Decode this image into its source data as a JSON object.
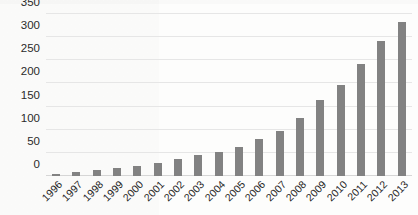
{
  "chart_data": {
    "type": "bar",
    "title": "",
    "subtitle": "",
    "xlabel": "",
    "ylabel": "",
    "categories": [
      "1996",
      "1997",
      "1998",
      "1999",
      "2000",
      "2001",
      "2002",
      "2003",
      "2004",
      "2005",
      "2006",
      "2007",
      "2008",
      "2009",
      "2010",
      "2011",
      "2012",
      "2013"
    ],
    "values": [
      5,
      8,
      12,
      17,
      22,
      28,
      37,
      45,
      52,
      62,
      80,
      98,
      125,
      165,
      197,
      242,
      292,
      332
    ],
    "series": [
      {
        "name": "Series 1",
        "values": [
          5,
          8,
          12,
          17,
          22,
          28,
          37,
          45,
          52,
          62,
          80,
          98,
          125,
          165,
          197,
          242,
          292,
          332
        ]
      }
    ],
    "ylim": [
      0,
      350
    ],
    "yticks": [
      0,
      50,
      100,
      150,
      200,
      250,
      300,
      350
    ],
    "ytick_labels": [
      "0",
      "50",
      "100",
      "150",
      "200",
      "250",
      "300",
      "350"
    ],
    "grid": true,
    "legend": false,
    "legend_position": "none",
    "bar_color": "#828282",
    "gridline_color": "#e6e6e6",
    "background_color": "#fdfdfc",
    "xtick_rotation": -45
  }
}
